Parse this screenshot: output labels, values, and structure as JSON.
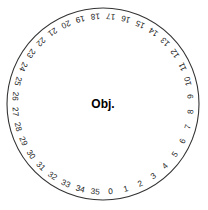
{
  "diagram": {
    "center_label": "Obj.",
    "sector_count": 36,
    "degrees_per_sector": 10,
    "zero_position": "bottom",
    "numbering_direction": "counterclockwise",
    "colors": {
      "background": "#ffffff",
      "circle_stroke": "#333333",
      "spoke_stroke": "#555555",
      "label_text": "#1a1a1a",
      "center_text": "#000000"
    },
    "geometry": {
      "center_x": 103,
      "center_y": 104,
      "radius": 96,
      "label_radius": 88,
      "hub_radius": 6
    },
    "tick_labels": [
      "0",
      "1",
      "2",
      "3",
      "4",
      "5",
      "6",
      "7",
      "8",
      "9",
      "10",
      "11",
      "12",
      "13",
      "14",
      "15",
      "16",
      "17",
      "18",
      "19",
      "20",
      "21",
      "22",
      "23",
      "24",
      "25",
      "26",
      "27",
      "28",
      "29",
      "30",
      "31",
      "32",
      "33",
      "34",
      "35"
    ]
  },
  "chart_data": {
    "type": "pie",
    "categories": [
      "0",
      "1",
      "2",
      "3",
      "4",
      "5",
      "6",
      "7",
      "8",
      "9",
      "10",
      "11",
      "12",
      "13",
      "14",
      "15",
      "16",
      "17",
      "18",
      "19",
      "20",
      "21",
      "22",
      "23",
      "24",
      "25",
      "26",
      "27",
      "28",
      "29",
      "30",
      "31",
      "32",
      "33",
      "34",
      "35"
    ],
    "values": [
      10,
      10,
      10,
      10,
      10,
      10,
      10,
      10,
      10,
      10,
      10,
      10,
      10,
      10,
      10,
      10,
      10,
      10,
      10,
      10,
      10,
      10,
      10,
      10,
      10,
      10,
      10,
      10,
      10,
      10,
      10,
      10,
      10,
      10,
      10,
      10
    ],
    "unit": "degrees",
    "legend": "none",
    "grid": false,
    "xlabel": "",
    "ylabel": "",
    "annotations": [
      "Obj."
    ]
  }
}
